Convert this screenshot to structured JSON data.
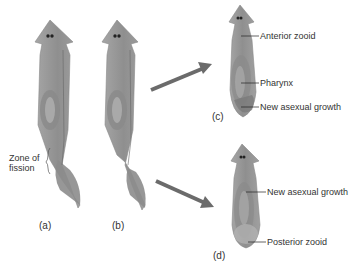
{
  "diagram": {
    "colors": {
      "body": "#9a9a9a",
      "body_dark": "#7a7a7a",
      "body_light": "#b8b8b8",
      "arrow": "#6b6b6b",
      "text": "#333333",
      "leader_line": "#222222"
    },
    "panels": [
      {
        "id": "a",
        "label": "(a)"
      },
      {
        "id": "b",
        "label": "(b)"
      },
      {
        "id": "c",
        "label": "(c)"
      },
      {
        "id": "d",
        "label": "(d)"
      }
    ],
    "annotations": {
      "zone_of_fission_line1": "Zone of",
      "zone_of_fission_line2": "fission",
      "anterior_zooid": "Anterior zooid",
      "pharynx": "Pharynx",
      "new_growth_c": "New asexual growth",
      "new_growth_d": "New asexual growth",
      "posterior_zooid": "Posterior zooid"
    },
    "arrows": [
      {
        "from": "b",
        "to": "c",
        "direction": "up-right"
      },
      {
        "from": "b",
        "to": "d",
        "direction": "down-right"
      }
    ]
  }
}
